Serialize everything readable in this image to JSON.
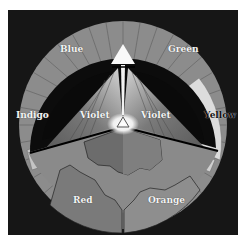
{
  "diagram": {
    "type": "color-wheel",
    "center_symbol": "triangle",
    "top_symbol": "triangle",
    "labels": {
      "blue": "Blue",
      "green": "Green",
      "indigo": "Indigo",
      "yellow": "Yellow",
      "violet_left": "Violet",
      "violet_right": "Violet",
      "red": "Red",
      "orange": "Orange"
    },
    "colors": {
      "background": "#161616",
      "ring": "#8a8a8a",
      "ring_light": "#d8d8d8",
      "inner_dark": "#0c0c0c",
      "beam": "#6e6e6e",
      "glow": "#ffffff"
    }
  }
}
